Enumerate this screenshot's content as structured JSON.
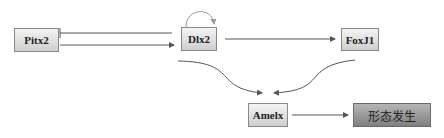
{
  "diagram": {
    "nodes": [
      {
        "id": "pitx2",
        "label": "Pitx2"
      },
      {
        "id": "dlx2",
        "label": "Dlx2"
      },
      {
        "id": "foxj1",
        "label": "FoxJ1"
      },
      {
        "id": "amelx",
        "label": "Amelx"
      },
      {
        "id": "morphogenesis",
        "label": "形态发生"
      }
    ],
    "edges": [
      {
        "from": "pitx2",
        "to": "dlx2",
        "type": "activation"
      },
      {
        "from": "dlx2",
        "to": "pitx2",
        "type": "inhibition"
      },
      {
        "from": "dlx2",
        "to": "dlx2",
        "type": "self-activation"
      },
      {
        "from": "dlx2",
        "to": "foxj1",
        "type": "activation"
      },
      {
        "from": "dlx2",
        "to": "amelx",
        "type": "activation"
      },
      {
        "from": "foxj1",
        "to": "amelx",
        "type": "activation"
      },
      {
        "from": "amelx",
        "to": "morphogenesis",
        "type": "activation"
      }
    ],
    "colors": {
      "line": "#555555",
      "self_loop": "#999999",
      "node_light": "#e0e0e0",
      "node_dark": "#999999"
    }
  }
}
